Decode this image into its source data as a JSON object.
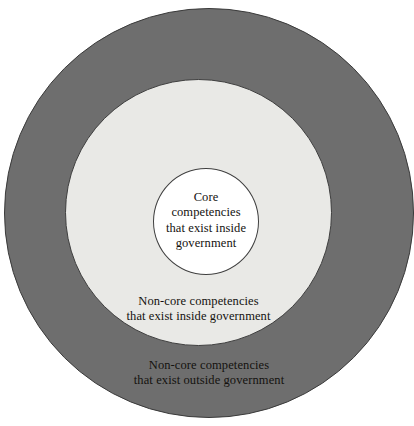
{
  "diagram": {
    "type": "concentric-circles",
    "background_color": "#ffffff",
    "rings": [
      {
        "id": "outer",
        "label": "Non-core competencies\nthat exist outside government",
        "fill_color": "#6e6e6e",
        "stroke_color": "#3a3a3a",
        "text_color": "#14120f"
      },
      {
        "id": "middle",
        "label": "Non-core competencies\nthat exist inside government",
        "fill_color": "#e9e9e6",
        "stroke_color": "#3f3f3f",
        "text_color": "#14120f"
      },
      {
        "id": "inner",
        "label": "Core\ncompetencies\nthat exist inside\ngovernment",
        "fill_color": "#ffffff",
        "stroke_color": "#3f3f3f",
        "text_color": "#14120f"
      }
    ]
  }
}
